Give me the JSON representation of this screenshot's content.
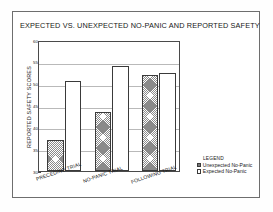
{
  "figure": {
    "title": "EXPECTED VS. UNEXPECTED NO-PANIC AND REPORTED SAFETY"
  },
  "legend": {
    "heading": "LEGEND",
    "entries": [
      {
        "label": "Unexpected No-Panic",
        "pattern": "hatched"
      },
      {
        "label": "Expected  No-Panic",
        "pattern": "plain"
      }
    ]
  },
  "chart_data": {
    "type": "bar",
    "title": "EXPECTED VS. UNEXPECTED NO-PANIC AND REPORTED SAFETY",
    "xlabel": "",
    "ylabel": "REPORTED SAFETY SCORES",
    "categories": [
      "PRECEDING TRIAL",
      "NO-PANIC TRIAL",
      "FOLLOWING TRIAL"
    ],
    "series": [
      {
        "name": "Unexpected No-Panic",
        "values": [
          37.0,
          43.5,
          52.0
        ]
      },
      {
        "name": "Expected  No-Panic",
        "values": [
          50.5,
          54.0,
          52.5
        ]
      }
    ],
    "ylim": [
      30,
      60
    ],
    "yticks": [
      30,
      35,
      40,
      45,
      50,
      55,
      60
    ],
    "ytick_labels": [
      "30",
      "35",
      "40",
      "45",
      "50",
      "55",
      "60"
    ],
    "grid": true,
    "legend_position": "bottom-right-outside",
    "bar_order": [
      "Unexpected No-Panic",
      "Expected  No-Panic"
    ]
  }
}
